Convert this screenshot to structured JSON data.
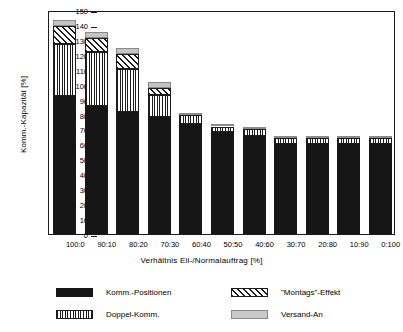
{
  "chart_data": {
    "type": "bar",
    "subtype": "stacked",
    "title": "",
    "xlabel": "Verhältnis  Eil-/Normalauftrag  [%]",
    "ylabel": "Komm.-Kapazität  [%]",
    "ylim": [
      0,
      150
    ],
    "ytick_step": 10,
    "yticks": [
      0,
      10,
      20,
      30,
      40,
      50,
      60,
      70,
      80,
      90,
      100,
      110,
      120,
      130,
      140,
      150
    ],
    "ytick_labels": [
      "0",
      "10",
      "20",
      "30",
      "40",
      "50",
      "60",
      "70",
      "80",
      "90",
      "100",
      "110",
      "120",
      "130",
      "140",
      "150"
    ],
    "grid": false,
    "legend_position": "bottom",
    "categories": [
      "100:0",
      "90:10",
      "80:20",
      "70:30",
      "60:40",
      "50:50",
      "40:60",
      "30:70",
      "20:80",
      "10:90",
      "0:100"
    ],
    "series": [
      {
        "name": "Komm.-Positionen",
        "pattern": "solid-black",
        "color": "#161616",
        "values": [
          92.5,
          86.0,
          82.0,
          78.5,
          73.5,
          68.5,
          65.5,
          60.5,
          60.5,
          60.5,
          60.5
        ]
      },
      {
        "name": "Doppel-Komm.",
        "pattern": "vertical-stripes",
        "color": "#1c1c1c",
        "values": [
          35.0,
          36.0,
          28.5,
          14.5,
          6.0,
          3.5,
          4.5,
          3.5,
          3.5,
          3.5,
          3.5
        ]
      },
      {
        "name": "\"Montags\"-Effekt",
        "pattern": "diagonal-stripes",
        "color": "#1c1c1c",
        "values": [
          11.5,
          9.0,
          10.0,
          5.0,
          0,
          0,
          0,
          0,
          0,
          0,
          0
        ]
      },
      {
        "name": "Versand-An",
        "pattern": "light-gray",
        "color": "#c4c4c4",
        "values": [
          4.0,
          4.0,
          4.0,
          4.0,
          1.5,
          1.5,
          1.5,
          1.5,
          1.5,
          1.5,
          1.5
        ]
      }
    ],
    "totals": [
      143.0,
      135.0,
      124.5,
      102.0,
      81.0,
      73.5,
      71.5,
      65.5,
      65.5,
      65.5,
      65.5
    ]
  },
  "legend": {
    "items": [
      {
        "label": "Komm.-Positionen",
        "swatch": "solid-black"
      },
      {
        "label": "\"Montags\"-Effekt",
        "swatch": "diagonal-stripes"
      },
      {
        "label": "Doppel-Komm.",
        "swatch": "vertical-stripes"
      },
      {
        "label": "Versand-An",
        "swatch": "light-gray"
      }
    ]
  }
}
